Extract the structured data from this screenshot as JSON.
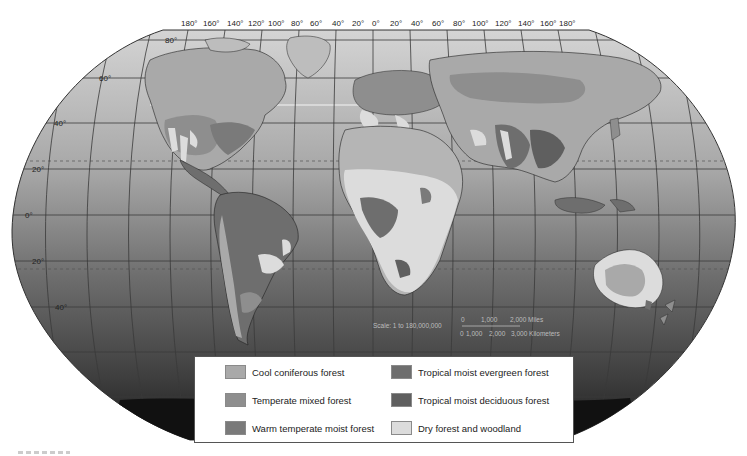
{
  "map": {
    "projection": "Robinson",
    "longitude_labels": [
      "180°",
      "160°",
      "140°",
      "120°",
      "100°",
      "80°",
      "60°",
      "40°",
      "20°",
      "0°",
      "20°",
      "40°",
      "60°",
      "80°",
      "100°",
      "120°",
      "140°",
      "160°",
      "180°"
    ],
    "latitude_labels": [
      {
        "label": "80°",
        "lat": 80
      },
      {
        "label": "60°",
        "lat": 60
      },
      {
        "label": "40°",
        "lat": 40
      },
      {
        "label": "20°",
        "lat": 20
      },
      {
        "label": "0°",
        "lat": 0
      },
      {
        "label": "20°",
        "lat": -20
      },
      {
        "label": "40°",
        "lat": -40
      }
    ],
    "scale": {
      "ratio_text": "Scale: 1 to 180,000,000",
      "miles_ticks": [
        "0",
        "1,000",
        "2,000 Miles"
      ],
      "km_ticks": [
        "0",
        "1,000",
        "2,000",
        "3,000 Kilometers"
      ]
    }
  },
  "legend": {
    "items": [
      {
        "label": "Cool coniferous forest",
        "color": "#a9a9a9"
      },
      {
        "label": "Temperate mixed forest",
        "color": "#8e8e8e"
      },
      {
        "label": "Warm temperate moist forest",
        "color": "#7a7a7a"
      },
      {
        "label": "Tropical moist evergreen forest",
        "color": "#6e6e6e"
      },
      {
        "label": "Tropical moist deciduous forest",
        "color": "#5f5f5f"
      },
      {
        "label": "Dry forest and woodland",
        "color": "#dcdcdc"
      }
    ]
  },
  "colors": {
    "ocean_top": "#d2d2d2",
    "ocean_bottom": "#2a2a2a",
    "land_base": "#b8b8b8",
    "grid": "#3a3a3a",
    "tropic_line": "#555555"
  }
}
